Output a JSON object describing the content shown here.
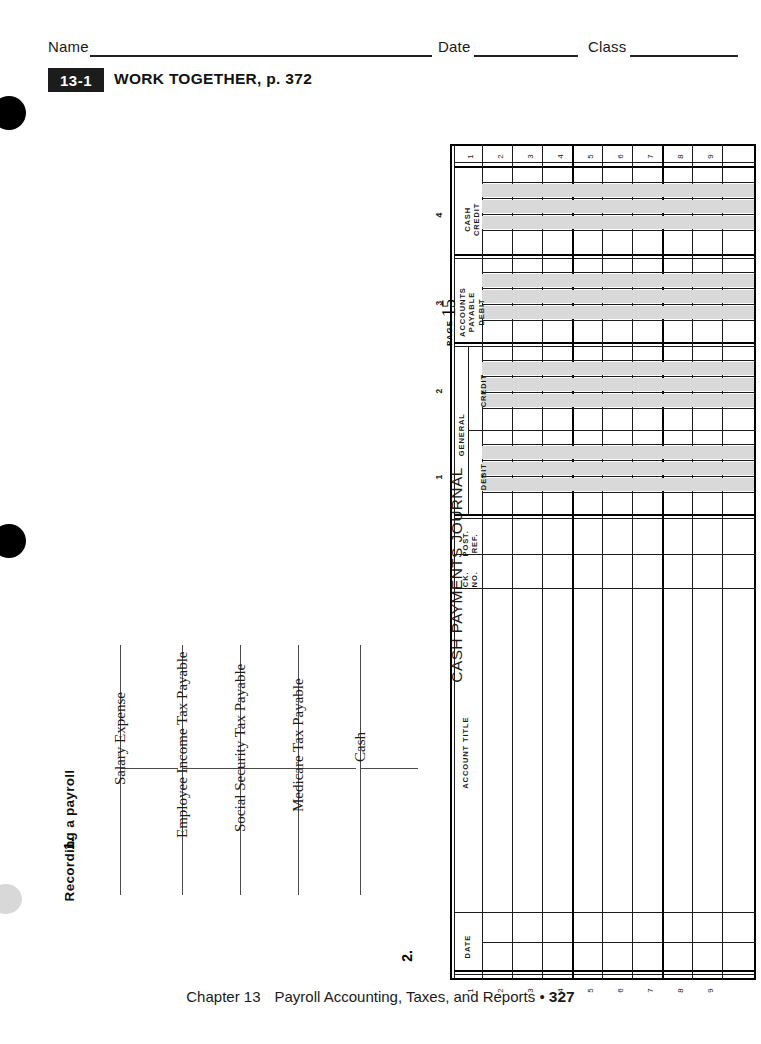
{
  "header": {
    "name_label": "Name",
    "date_label": "Date",
    "class_label": "Class"
  },
  "lesson": {
    "badge": "13-1",
    "title": "WORK TOGETHER, p. 372"
  },
  "section": {
    "heading": "Recording a payroll",
    "item_1": "1.",
    "item_2": "2."
  },
  "t_accounts": [
    {
      "title": "Salary Expense"
    },
    {
      "title": "Employee Income Tax Payable"
    },
    {
      "title": "Social Security Tax Payable"
    },
    {
      "title": "Medicare Tax Payable"
    },
    {
      "title": "Cash"
    }
  ],
  "journal": {
    "title": "CASH PAYMENTS JOURNAL",
    "page_word": "PAGE",
    "page_number": "15",
    "columns": [
      {
        "label": "DATE",
        "number": ""
      },
      {
        "label": "ACCOUNT TITLE",
        "number": ""
      },
      {
        "label": "CK.\nNO.",
        "number": ""
      },
      {
        "label": "POST.\nREF.",
        "number": ""
      },
      {
        "label": "DEBIT",
        "number": "1",
        "group": "GENERAL"
      },
      {
        "label": "CREDIT",
        "number": "2",
        "group": "GENERAL"
      },
      {
        "label": "ACCOUNTS\nPAYABLE\nDEBIT",
        "number": "3"
      },
      {
        "label": "CASH\nCREDIT",
        "number": "4"
      }
    ],
    "group_general": "GENERAL",
    "ck_no_label_line1": "CK.",
    "ck_no_label_line2": "NO.",
    "post_ref_label_line1": "POST.",
    "post_ref_label_line2": "REF.",
    "ap_label_line1": "ACCOUNTS",
    "ap_label_line2": "PAYABLE",
    "ap_label_line3": "DEBIT",
    "cash_label_line1": "CASH",
    "cash_label_line2": "CREDIT",
    "general_debit_label": "DEBIT",
    "general_credit_label": "CREDIT",
    "account_title_label": "ACCOUNT TITLE",
    "date_label": "DATE",
    "row_numbers": [
      "1",
      "2",
      "3",
      "4",
      "5",
      "6",
      "7",
      "8",
      "9"
    ]
  },
  "footer": {
    "chapter": "Chapter 13",
    "title": "Payroll Accounting, Taxes, and Reports",
    "bullet": "•",
    "page": "327"
  }
}
